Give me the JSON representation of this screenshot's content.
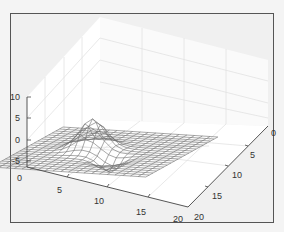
{
  "chart_data": {
    "type": "surface-mesh",
    "title": "",
    "xlabel": "",
    "ylabel": "",
    "zlabel": "",
    "x_ticks": [
      "0",
      "5",
      "10",
      "15",
      "20"
    ],
    "y_ticks": [
      "0",
      "5",
      "10",
      "15",
      "20"
    ],
    "z_ticks": [
      "-5",
      "0",
      "5",
      "10"
    ],
    "xlim": [
      0,
      20
    ],
    "ylim": [
      0,
      20
    ],
    "zlim": [
      -5,
      10
    ],
    "grid": true,
    "grid_size": [
      21,
      21
    ],
    "features": [
      {
        "kind": "peak",
        "x": 9,
        "y": 8,
        "z": 7
      },
      {
        "kind": "trough",
        "x": 13,
        "y": 12,
        "z": -3
      }
    ],
    "colors": {
      "mesh": "#777777",
      "background": "#f0f0f0",
      "axes": "#555555"
    }
  }
}
